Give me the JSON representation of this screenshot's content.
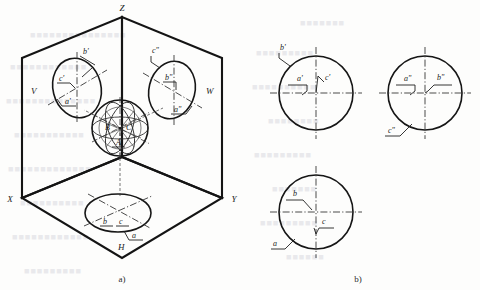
{
  "figure": {
    "caption_left": "a)",
    "caption_right": "b)"
  },
  "pictorial": {
    "planes": [
      {
        "name": "V",
        "label": "V"
      },
      {
        "name": "W",
        "label": "W"
      },
      {
        "name": "H",
        "label": "H"
      }
    ],
    "axes": [
      {
        "name": "X",
        "label": "X"
      },
      {
        "name": "Y",
        "label": "Y"
      },
      {
        "name": "Z",
        "label": "Z"
      }
    ],
    "sphere_points": [
      {
        "name": "A",
        "label": "A"
      },
      {
        "name": "B",
        "label": "B"
      },
      {
        "name": "C",
        "label": "C"
      }
    ],
    "v_plane_points": [
      {
        "name": "b-prime",
        "label": "b'"
      },
      {
        "name": "c-prime",
        "label": "c'"
      },
      {
        "name": "a-prime",
        "label": "a'"
      }
    ],
    "w_plane_points": [
      {
        "name": "c-double-prime",
        "label": "c\""
      },
      {
        "name": "b-double-prime",
        "label": "b\""
      },
      {
        "name": "a-double-prime",
        "label": "a\""
      }
    ],
    "h_plane_points": [
      {
        "name": "b",
        "label": "b"
      },
      {
        "name": "c",
        "label": "c"
      },
      {
        "name": "a",
        "label": "a"
      }
    ]
  },
  "views": {
    "front": {
      "name": "front-view",
      "points": [
        {
          "name": "b-prime",
          "label": "b'"
        },
        {
          "name": "a-prime",
          "label": "a'"
        },
        {
          "name": "c-prime",
          "label": "c'"
        }
      ]
    },
    "side": {
      "name": "side-view",
      "points": [
        {
          "name": "a-double-prime",
          "label": "a\""
        },
        {
          "name": "b-double-prime",
          "label": "b\""
        },
        {
          "name": "c-double-prime",
          "label": "c\""
        }
      ]
    },
    "top": {
      "name": "top-view",
      "points": [
        {
          "name": "b",
          "label": "b"
        },
        {
          "name": "c",
          "label": "c"
        },
        {
          "name": "a",
          "label": "a"
        }
      ]
    }
  },
  "ghost_text": [
    {
      "name": "ghost-row-1",
      "text": "■■■■■■■■■■■■■■■",
      "x": 30,
      "y": 30
    },
    {
      "name": "ghost-row-2",
      "text": "■■■■■■■■■■■■",
      "x": 10,
      "y": 62
    },
    {
      "name": "ghost-row-3",
      "text": "■■■■■■■■■■■■■■",
      "x": 6,
      "y": 96
    },
    {
      "name": "ghost-row-4",
      "text": "■■■■■■■■■■■",
      "x": 14,
      "y": 130
    },
    {
      "name": "ghost-row-5",
      "text": "■■■■■■■■■■■■■",
      "x": 8,
      "y": 164
    },
    {
      "name": "ghost-row-6",
      "text": "■■■■■■■■■■",
      "x": 20,
      "y": 198
    },
    {
      "name": "ghost-row-7",
      "text": "■■■■■■■■■■■■",
      "x": 12,
      "y": 232
    },
    {
      "name": "ghost-row-8",
      "text": "■■■■■■■■■",
      "x": 24,
      "y": 266
    },
    {
      "name": "ghost-row-9",
      "text": "■■■■■■■",
      "x": 300,
      "y": 18
    },
    {
      "name": "ghost-row-10",
      "text": "■■■■■■■■■",
      "x": 256,
      "y": 48
    },
    {
      "name": "ghost-row-11",
      "text": "■■■■■■■■■■",
      "x": 252,
      "y": 82
    },
    {
      "name": "ghost-row-12",
      "text": "■■■■■■■■",
      "x": 268,
      "y": 116
    },
    {
      "name": "ghost-row-13",
      "text": "■■■■■■■■■",
      "x": 254,
      "y": 150
    },
    {
      "name": "ghost-row-14",
      "text": "■■■■■■■",
      "x": 272,
      "y": 184
    },
    {
      "name": "ghost-row-15",
      "text": "■■■■■■■■■",
      "x": 260,
      "y": 218
    },
    {
      "name": "ghost-row-16",
      "text": "■■■■■■",
      "x": 286,
      "y": 252
    }
  ]
}
